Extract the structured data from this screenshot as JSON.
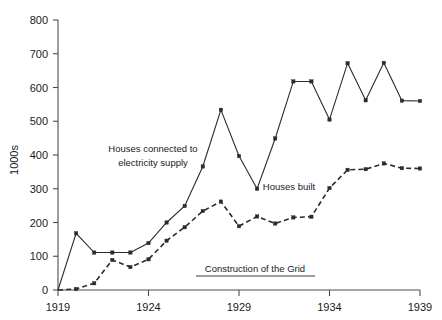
{
  "chart_data": {
    "type": "line",
    "title": "",
    "xlabel": "",
    "ylabel": "1000s",
    "xlim": [
      1919,
      1939
    ],
    "ylim": [
      0,
      800
    ],
    "grid": false,
    "legend_position": "inline-annotations",
    "x_tick_labels": [
      "1919",
      "1924",
      "1929",
      "1934",
      "1939"
    ],
    "x_ticks": [
      1919,
      1924,
      1929,
      1934,
      1939
    ],
    "y_tick_labels": [
      "0",
      "100",
      "200",
      "300",
      "400",
      "500",
      "600",
      "700",
      "800"
    ],
    "y_ticks": [
      0,
      100,
      200,
      300,
      400,
      500,
      600,
      700,
      800
    ],
    "x": [
      1919,
      1920,
      1921,
      1922,
      1923,
      1924,
      1925,
      1926,
      1927,
      1928,
      1929,
      1930,
      1931,
      1932,
      1933,
      1934,
      1935,
      1936,
      1937,
      1938,
      1939
    ],
    "series": [
      {
        "name": "Houses connected to electricity supply",
        "style": "solid",
        "marker": "square",
        "values": [
          0,
          168,
          111,
          111,
          111,
          139,
          200,
          249,
          366,
          534,
          397,
          300,
          449,
          618,
          618,
          505,
          672,
          562,
          673,
          561,
          560
        ]
      },
      {
        "name": "Houses built",
        "style": "dashed",
        "marker": "square",
        "values": [
          0,
          3,
          20,
          89,
          68,
          91,
          146,
          186,
          234,
          262,
          189,
          218,
          197,
          215,
          217,
          302,
          356,
          358,
          375,
          361,
          360
        ]
      }
    ],
    "annotations": [
      {
        "id": "series-label-electricity",
        "lines": [
          "Houses connected to",
          "electricity supply"
        ],
        "x_px": 153,
        "y_px": 152
      },
      {
        "id": "series-label-houses-built",
        "lines": [
          "Houses built"
        ],
        "x_px": 289,
        "y_px": 190
      },
      {
        "id": "grid-construction-span",
        "lines": [
          "Construction of the Grid"
        ],
        "x_px": 255,
        "y_px": 272,
        "underlined": true
      }
    ]
  },
  "axis": {
    "y_title": "1000s"
  },
  "labels": {
    "electricity_line1": "Houses connected to",
    "electricity_line2": "electricity supply",
    "houses_built": "Houses built",
    "construction_of_grid": "Construction of the Grid"
  },
  "colors": {
    "series_stroke": "#2b2b2b",
    "axis": "#4d4d4d",
    "text": "#1a1a1a",
    "background": "#ffffff"
  }
}
